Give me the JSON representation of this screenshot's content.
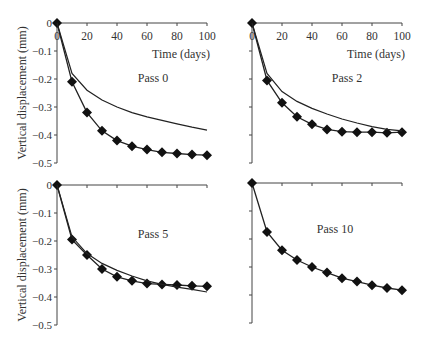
{
  "chart_data": [
    {
      "type": "line",
      "title": "Pass 0",
      "xlabel": "Time (days)",
      "ylabel": "Vertical displacement (mm)",
      "x_ticks": [
        0,
        20,
        40,
        60,
        80,
        100
      ],
      "y_ticks": [
        0,
        -0.1,
        -0.2,
        -0.3,
        -0.4,
        -0.5
      ],
      "xlim": [
        0,
        100
      ],
      "ylim": [
        -0.5,
        0
      ],
      "series": [
        {
          "name": "Measured",
          "marker": "diamond",
          "x": [
            0,
            10,
            20,
            30,
            40,
            50,
            60,
            70,
            80,
            90,
            100
          ],
          "values": [
            0,
            -0.21,
            -0.32,
            -0.385,
            -0.42,
            -0.44,
            -0.452,
            -0.462,
            -0.466,
            -0.47,
            -0.472
          ]
        },
        {
          "name": "Predicted",
          "marker": "none",
          "x": [
            0,
            10,
            20,
            30,
            40,
            50,
            60,
            70,
            80,
            90,
            100
          ],
          "values": [
            0,
            -0.18,
            -0.24,
            -0.275,
            -0.3,
            -0.32,
            -0.335,
            -0.348,
            -0.36,
            -0.372,
            -0.383
          ]
        }
      ]
    },
    {
      "type": "line",
      "title": "Pass 2",
      "xlabel": "Time (days)",
      "ylabel": "",
      "x_ticks": [
        0,
        20,
        40,
        60,
        80,
        100
      ],
      "xlim": [
        0,
        100
      ],
      "ylim": [
        -0.5,
        0
      ],
      "series": [
        {
          "name": "Measured",
          "marker": "diamond",
          "x": [
            0,
            10,
            20,
            30,
            40,
            50,
            60,
            70,
            80,
            90,
            100
          ],
          "values": [
            0,
            -0.205,
            -0.285,
            -0.335,
            -0.362,
            -0.38,
            -0.388,
            -0.39,
            -0.39,
            -0.392,
            -0.39
          ]
        },
        {
          "name": "Predicted",
          "marker": "none",
          "x": [
            0,
            10,
            20,
            30,
            40,
            50,
            60,
            70,
            80,
            90,
            100
          ],
          "values": [
            0,
            -0.18,
            -0.245,
            -0.28,
            -0.305,
            -0.325,
            -0.343,
            -0.357,
            -0.37,
            -0.38,
            -0.385
          ]
        }
      ]
    },
    {
      "type": "line",
      "title": "Pass 5",
      "xlabel": "",
      "ylabel": "Vertical displacement (mm)",
      "y_ticks": [
        0,
        -0.1,
        -0.2,
        -0.3,
        -0.4,
        -0.5
      ],
      "xlim": [
        0,
        100
      ],
      "ylim": [
        -0.5,
        0
      ],
      "series": [
        {
          "name": "Measured",
          "marker": "diamond",
          "x": [
            0,
            10,
            20,
            30,
            40,
            50,
            60,
            70,
            80,
            90,
            100
          ],
          "values": [
            0,
            -0.195,
            -0.25,
            -0.3,
            -0.328,
            -0.342,
            -0.352,
            -0.355,
            -0.357,
            -0.36,
            -0.362
          ]
        },
        {
          "name": "Predicted",
          "marker": "none",
          "x": [
            0,
            10,
            20,
            30,
            40,
            50,
            60,
            70,
            80,
            90,
            100
          ],
          "values": [
            0,
            -0.185,
            -0.245,
            -0.28,
            -0.305,
            -0.325,
            -0.342,
            -0.355,
            -0.365,
            -0.373,
            -0.382
          ]
        }
      ]
    },
    {
      "type": "line",
      "title": "Pass 10",
      "xlabel": "",
      "ylabel": "",
      "xlim": [
        0,
        100
      ],
      "ylim": [
        -0.5,
        0
      ],
      "series": [
        {
          "name": "Measured",
          "marker": "diamond",
          "x": [
            0,
            10,
            20,
            30,
            40,
            50,
            60,
            70,
            80,
            90,
            100
          ],
          "values": [
            0,
            -0.175,
            -0.24,
            -0.275,
            -0.3,
            -0.32,
            -0.34,
            -0.352,
            -0.365,
            -0.375,
            -0.383
          ]
        }
      ]
    }
  ]
}
